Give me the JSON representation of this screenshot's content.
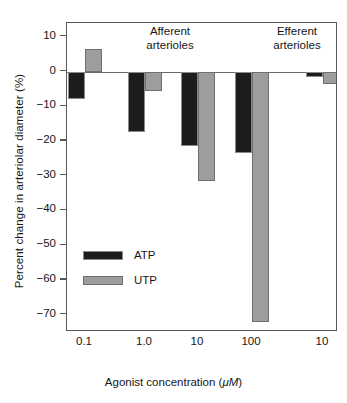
{
  "chart_data": {
    "type": "bar",
    "title": "",
    "xlabel": "Agonist concentration (μM)",
    "xlabel_plain": "Agonist concentration (",
    "xlabel_italic": "μM",
    "xlabel_tail": ")",
    "ylabel": "Percent change in arteriolar diameter (%)",
    "ylim": [
      -75,
      14
    ],
    "yticks": [
      10,
      0,
      -10,
      -20,
      -30,
      -40,
      -50,
      -60,
      -70
    ],
    "ytick_labels": [
      "10",
      "0",
      "−10",
      "−20",
      "−30",
      "−40",
      "−50",
      "−60",
      "−70"
    ],
    "grid": false,
    "legend_position": "inside-lower-left",
    "categories": [
      "0.1",
      "1.0",
      "10",
      "100",
      "10"
    ],
    "groups": [
      {
        "label": "Afferent\narterioles",
        "line1": "Afferent",
        "line2": "arterioles",
        "categories": [
          "0.1",
          "1.0",
          "10",
          "100"
        ]
      },
      {
        "label": "Efferent\narterioles",
        "line1": "Efferent",
        "line2": "arterioles",
        "categories": [
          "10"
        ]
      }
    ],
    "series": [
      {
        "name": "ATP",
        "color": "#1c1c1c",
        "values": [
          -8.0,
          -17.5,
          -21.5,
          -23.5,
          -1.5
        ]
      },
      {
        "name": "UTP",
        "color": "#9d9d9d",
        "values": [
          6.5,
          -5.5,
          -31.5,
          -72.0,
          -3.5
        ]
      }
    ]
  },
  "legend": {
    "entries": [
      {
        "label": "ATP",
        "swatch": "atp-swatch"
      },
      {
        "label": "UTP",
        "swatch": "utp-swatch"
      }
    ]
  }
}
